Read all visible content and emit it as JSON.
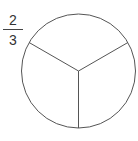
{
  "fraction": {
    "numerator": "2",
    "denominator": "3"
  },
  "circle": {
    "center": [
      78.5,
      71
    ],
    "radius": 57,
    "parts": 3,
    "stroke": "#555555",
    "fill": "#ffffff"
  }
}
